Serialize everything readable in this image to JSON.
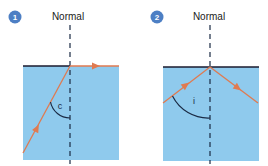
{
  "colors": {
    "water": "#8fcaed",
    "ray": "#e07a50",
    "surface": "#1a1a2e",
    "normal": "#1a2a44",
    "badge": "#4d7fc4"
  },
  "panels": [
    {
      "number": "1",
      "normal_label": "Normal",
      "angle_label": "c",
      "description": "Ray at critical angle refracts along the surface"
    },
    {
      "number": "2",
      "normal_label": "Normal",
      "angle_label": "i",
      "description": "Ray beyond critical angle undergoes total internal reflection"
    }
  ]
}
